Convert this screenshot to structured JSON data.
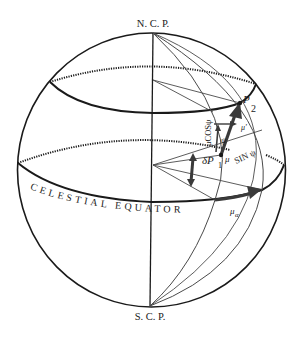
{
  "diagram": {
    "type": "celestial-sphere-proper-motion",
    "colors": {
      "background": "#ffffff",
      "ink": "#1a1a1a",
      "thin_line": "#4a4a4a",
      "arrow": "#3a3a3a"
    },
    "labels": {
      "north_pole": "N. C. P.",
      "south_pole": "S. C. P.",
      "equator": "CELESTIAL EQUATOR",
      "point_2": "P",
      "point_2_sub": "2",
      "point_1": "δP",
      "point_1_sub": "1",
      "mu": "μ",
      "mu_prime": "μ'",
      "mu_alpha": "μ",
      "mu_alpha_sub": "α",
      "mu_cos_psi": "μCOSψ",
      "mu_sin_psi": "SIN ψ",
      "psi": "ψ"
    }
  }
}
